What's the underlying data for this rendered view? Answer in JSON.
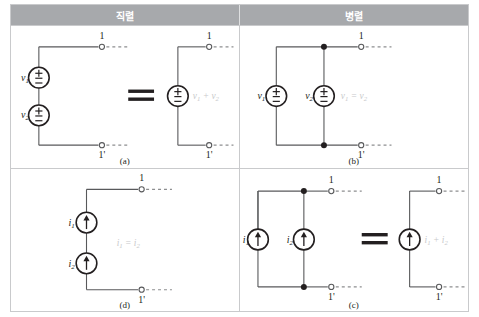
{
  "figure": {
    "kind": "circuit-equivalence-table",
    "header": {
      "series_label": "직렬",
      "parallel_label": "병렬"
    },
    "colors": {
      "header_bg": "#a7a9ac",
      "header_text": "#ffffff",
      "border": "#c9cacc",
      "wire": "#58595b",
      "symbol": "#231f20",
      "annotation": "#c8c9cb"
    },
    "panels": [
      {
        "id": "a",
        "caption": "(a)",
        "position": "top-left",
        "category": "series",
        "source_type": "voltage",
        "sources": [
          {
            "label": "v",
            "sub": "1",
            "symbol": "plus-minus"
          },
          {
            "label": "v",
            "sub": "2",
            "symbol": "plus-minus"
          }
        ],
        "relation": "equivalence",
        "relation_glyph": "=",
        "result": {
          "label": "v",
          "sub": "1",
          "operator": "+",
          "label2": "v",
          "sub2": "2",
          "symbol": "plus-minus"
        },
        "result_text": "v₁ + v₂",
        "terminals": {
          "top": "1",
          "bottom": "1'"
        }
      },
      {
        "id": "b",
        "caption": "(b)",
        "position": "top-right",
        "category": "parallel",
        "source_type": "voltage",
        "sources": [
          {
            "label": "v",
            "sub": "1",
            "symbol": "plus-minus"
          },
          {
            "label": "v",
            "sub": "2",
            "symbol": "plus-minus"
          }
        ],
        "relation": "constraint",
        "constraint_text": "v₁ = v₂",
        "terminals": {
          "top": "1",
          "bottom": "1'"
        }
      },
      {
        "id": "d",
        "caption": "(d)",
        "position": "bottom-left",
        "category": "series",
        "source_type": "current",
        "sources": [
          {
            "label": "i",
            "sub": "1",
            "symbol": "arrow-up"
          },
          {
            "label": "i",
            "sub": "2",
            "symbol": "arrow-up"
          }
        ],
        "relation": "constraint",
        "constraint_text": "i₁ = i₂",
        "terminals": {
          "top": "1",
          "bottom": "1'"
        }
      },
      {
        "id": "c",
        "caption": "(c)",
        "position": "bottom-right",
        "category": "parallel",
        "source_type": "current",
        "sources": [
          {
            "label": "i",
            "sub": "1",
            "symbol": "arrow-up"
          },
          {
            "label": "i",
            "sub": "2",
            "symbol": "arrow-up"
          }
        ],
        "relation": "equivalence",
        "relation_glyph": "=",
        "result_text": "i₁ + i₂",
        "terminals": {
          "top": "1",
          "bottom": "1'"
        }
      }
    ],
    "labels": {
      "v1": "v",
      "v1_sub": "1",
      "v2": "v",
      "v2_sub": "2",
      "i1": "i",
      "i1_sub": "1",
      "i2": "i",
      "i2_sub": "2",
      "terminal_top": "1",
      "terminal_bottom": "1'",
      "equals": "=",
      "plus": "+"
    }
  }
}
